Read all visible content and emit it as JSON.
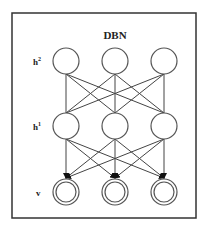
{
  "diagram": {
    "title": "DBN",
    "layers": [
      {
        "id": "h2",
        "label": "h",
        "sup": "2",
        "type": "hidden",
        "nodes": 3
      },
      {
        "id": "h1",
        "label": "h",
        "sup": "1",
        "type": "hidden",
        "nodes": 3
      },
      {
        "id": "v",
        "label": "v",
        "sup": "",
        "type": "visible",
        "nodes": 3
      }
    ],
    "connections": [
      {
        "from": "h2",
        "to": "h1",
        "style": "undirected",
        "pattern": "fully-connected"
      },
      {
        "from": "h1",
        "to": "v",
        "style": "directed-arrow",
        "pattern": "fully-connected"
      }
    ],
    "colors": {
      "stroke": "#444444",
      "background": "#ffffff"
    }
  }
}
